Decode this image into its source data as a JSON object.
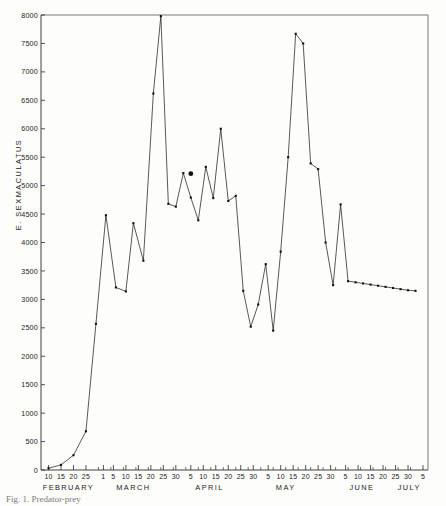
{
  "figure": {
    "caption": "Fig. 1. Predator-prey",
    "background_color": "#fdfdfb",
    "line_color": "#222222"
  },
  "chart_data": {
    "type": "line",
    "title": "",
    "xlabel": "",
    "ylabel": "E. SEXMACULATUS",
    "ylim": [
      0,
      8000
    ],
    "ytick_step": 500,
    "grid": false,
    "legend": null,
    "yticks": [
      0,
      500,
      1000,
      1500,
      2000,
      2500,
      3000,
      3500,
      4000,
      4500,
      5000,
      5500,
      6000,
      6500,
      7000,
      7500,
      8000
    ],
    "ytick_labels": [
      "0",
      "500",
      "1000",
      "1500",
      "2000",
      "2500",
      "3000",
      "3500",
      "4000",
      "4500",
      "5000",
      "5500",
      "6000",
      "6500",
      "7000",
      "7500",
      "8000"
    ],
    "months": [
      {
        "name": "FEBRUARY",
        "start_day": 8,
        "end_day": 28
      },
      {
        "name": "MARCH",
        "start_day": 29,
        "end_day": 59
      },
      {
        "name": "APRIL",
        "start_day": 60,
        "end_day": 89
      },
      {
        "name": "MAY",
        "start_day": 90,
        "end_day": 120
      },
      {
        "name": "JUNE",
        "start_day": 121,
        "end_day": 150
      },
      {
        "name": "JULY",
        "start_day": 151,
        "end_day": 158
      }
    ],
    "xtick_labels": [
      {
        "label": "10",
        "day": 10
      },
      {
        "label": "15",
        "day": 15
      },
      {
        "label": "20",
        "day": 20
      },
      {
        "label": "25",
        "day": 25
      },
      {
        "label": "1",
        "day": 32
      },
      {
        "label": "5",
        "day": 36
      },
      {
        "label": "10",
        "day": 41
      },
      {
        "label": "15",
        "day": 46
      },
      {
        "label": "20",
        "day": 51
      },
      {
        "label": "25",
        "day": 56
      },
      {
        "label": "30",
        "day": 61
      },
      {
        "label": "5",
        "day": 67
      },
      {
        "label": "10",
        "day": 72
      },
      {
        "label": "15",
        "day": 77
      },
      {
        "label": "20",
        "day": 82
      },
      {
        "label": "25",
        "day": 87
      },
      {
        "label": "30",
        "day": 92
      },
      {
        "label": "5",
        "day": 98
      },
      {
        "label": "10",
        "day": 103
      },
      {
        "label": "15",
        "day": 108
      },
      {
        "label": "20",
        "day": 113
      },
      {
        "label": "25",
        "day": 118
      },
      {
        "label": "30",
        "day": 123
      },
      {
        "label": "5",
        "day": 129
      },
      {
        "label": "10",
        "day": 134
      },
      {
        "label": "15",
        "day": 139
      },
      {
        "label": "20",
        "day": 144
      },
      {
        "label": "25",
        "day": 149
      },
      {
        "label": "30",
        "day": 154
      },
      {
        "label": "5",
        "day": 160
      }
    ],
    "series": [
      {
        "name": "E. sexmaculatus",
        "x": [
          10,
          15,
          20,
          25,
          29,
          33,
          37,
          41,
          44,
          48,
          52,
          55,
          58,
          61,
          64,
          67,
          70,
          73,
          76,
          79,
          82,
          85,
          88,
          91,
          94,
          97,
          100,
          103,
          106,
          109,
          112,
          115,
          118,
          121,
          124,
          127,
          130,
          133,
          136,
          139,
          142,
          145,
          148,
          151,
          154,
          157
        ],
        "y": [
          30,
          90,
          260,
          680,
          2570,
          4480,
          3210,
          3140,
          4340,
          3680,
          6620,
          7980,
          4680,
          4630,
          5220,
          4790,
          4390,
          5330,
          4780,
          6000,
          4730,
          4820,
          3150,
          2520,
          2910,
          3620,
          2450,
          3840,
          5500,
          7670,
          7500,
          5390,
          5290,
          4000,
          3250,
          4670,
          3320,
          3300,
          3280,
          3260,
          3240,
          3220,
          3200,
          3180,
          3160,
          3150
        ]
      }
    ],
    "annotations": [
      {
        "type": "isolated-point",
        "x": 67,
        "y": 5210,
        "note": "larger solitary dot"
      }
    ]
  }
}
